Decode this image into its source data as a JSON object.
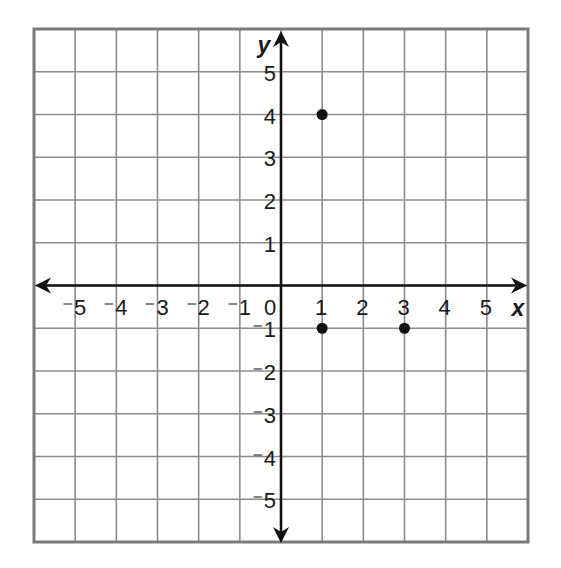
{
  "chart_data": {
    "type": "scatter",
    "title": "",
    "xlabel": "x",
    "ylabel": "y",
    "xlim": [
      -6,
      6
    ],
    "ylim": [
      -6,
      6
    ],
    "grid": true,
    "x_ticks": [
      -5,
      -4,
      -3,
      -2,
      -1,
      0,
      1,
      2,
      3,
      4,
      5
    ],
    "y_ticks": [
      -5,
      -4,
      -3,
      -2,
      -1,
      1,
      2,
      3,
      4,
      5
    ],
    "x_tick_labels": [
      "⁻5",
      "⁻4",
      "⁻3",
      "⁻2",
      "⁻1",
      "0",
      "1",
      "2",
      "3",
      "4",
      "5"
    ],
    "y_tick_labels": [
      "⁻5",
      "⁻4",
      "⁻3",
      "⁻2",
      "⁻1",
      "1",
      "2",
      "3",
      "4",
      "5"
    ],
    "series": [
      {
        "name": "points",
        "points": [
          {
            "x": 1,
            "y": 4
          },
          {
            "x": 1,
            "y": -1
          },
          {
            "x": 3,
            "y": -1
          }
        ]
      }
    ]
  },
  "colors": {
    "grid": "#8c8c8c",
    "border": "#7a7a7a",
    "axis": "#111111",
    "point": "#111111",
    "background": "#ffffff"
  },
  "labels": {
    "x_axis_label": "x",
    "y_axis_label": "y",
    "origin_label": "0"
  }
}
